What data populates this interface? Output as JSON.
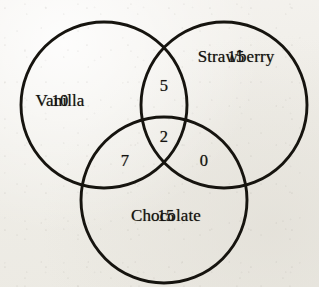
{
  "figure": {
    "type": "venn-diagram-3-set",
    "stroke_color": "#16140f",
    "text_color": "#151310",
    "background_color": "#f1efe9"
  },
  "chart_data": {
    "type": "venn",
    "title": "",
    "sets": [
      "Vanilla",
      "Strawberry",
      "Chocolate"
    ],
    "set_labels": [
      {
        "name": "Vanilla",
        "label": "Vanilla",
        "x": 104,
        "y": 58
      },
      {
        "name": "Strawberry",
        "label": "Strawberry",
        "x": 238,
        "y": 99
      },
      {
        "name": "Chocolate",
        "label": "Chocolate",
        "x": 167,
        "y": 257
      }
    ],
    "circles": [
      {
        "name": "Vanilla",
        "cx": 104,
        "cy": 105,
        "r": 83
      },
      {
        "name": "Strawberry",
        "cx": 224,
        "cy": 105,
        "r": 83
      },
      {
        "name": "Chocolate",
        "cx": 164,
        "cy": 200,
        "r": 83
      }
    ],
    "regions": [
      {
        "name": "vanilla-only",
        "sets": [
          "Vanilla"
        ],
        "label": "10",
        "value": 10,
        "x": 60,
        "y": 101
      },
      {
        "name": "strawberry-only",
        "sets": [
          "Strawberry"
        ],
        "label": "15",
        "value": 15,
        "x": 236,
        "y": 57
      },
      {
        "name": "chocolate-only",
        "sets": [
          "Chocolate"
        ],
        "label": "15",
        "value": 15,
        "x": 166,
        "y": 216
      },
      {
        "name": "vanilla-strawberry",
        "sets": [
          "Vanilla",
          "Strawberry"
        ],
        "label": "5",
        "value": 5,
        "x": 164,
        "y": 86
      },
      {
        "name": "vanilla-chocolate",
        "sets": [
          "Vanilla",
          "Chocolate"
        ],
        "label": "7",
        "value": 7,
        "x": 125,
        "y": 161
      },
      {
        "name": "strawberry-chocolate",
        "sets": [
          "Strawberry",
          "Chocolate"
        ],
        "label": "0",
        "value": 0,
        "x": 204,
        "y": 161
      },
      {
        "name": "vanilla-strawberry-chocolate",
        "sets": [
          "Vanilla",
          "Strawberry",
          "Chocolate"
        ],
        "label": "2",
        "value": 2,
        "x": 164,
        "y": 137
      }
    ],
    "totals": {
      "vanilla": 24,
      "strawberry": 22,
      "chocolate": 24,
      "all": 54
    }
  }
}
